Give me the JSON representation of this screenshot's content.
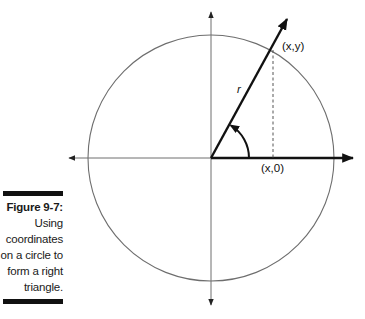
{
  "figure": {
    "number_label": "Figure 9-7:",
    "caption_lines": [
      "Using",
      "coordinates",
      "on a circle to",
      "form a right",
      "triangle."
    ]
  },
  "diagram": {
    "labels": {
      "point_xy": "(x,y)",
      "point_x0": "(x,0)",
      "radius": "r"
    },
    "colors": {
      "axis": "#6e6e6e",
      "bold_line": "#111111",
      "circle": "#6e6e6e",
      "caption_bar": "#111111"
    },
    "geometry": {
      "origin": [
        211,
        158
      ],
      "circle_radius": 123,
      "terminal_point": [
        273,
        50
      ],
      "angle_arc_radius": 38
    }
  }
}
